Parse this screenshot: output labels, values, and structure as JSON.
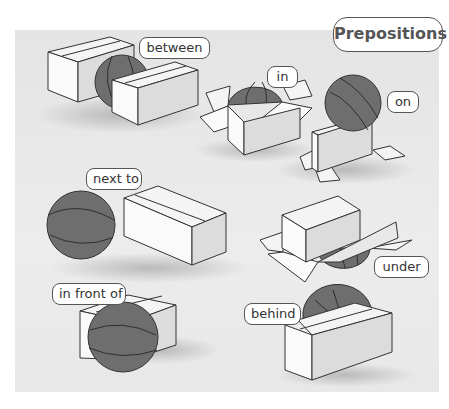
{
  "title": "Prepositions",
  "colors": {
    "panel_background": "#e6e6e6",
    "ball": "#6e6e6e",
    "ball_seam": "#2e2e2e",
    "box_face_light": "#fafafa",
    "box_face_shade": "#d8d8d8",
    "outline": "#333333",
    "label_border": "#555555",
    "label_text": "#333333"
  },
  "scenes": [
    {
      "id": "between",
      "label": "between"
    },
    {
      "id": "in",
      "label": "in"
    },
    {
      "id": "on",
      "label": "on"
    },
    {
      "id": "next-to",
      "label": "next to"
    },
    {
      "id": "under",
      "label": "under"
    },
    {
      "id": "in-front-of",
      "label": "in front of"
    },
    {
      "id": "behind",
      "label": "behind"
    }
  ]
}
